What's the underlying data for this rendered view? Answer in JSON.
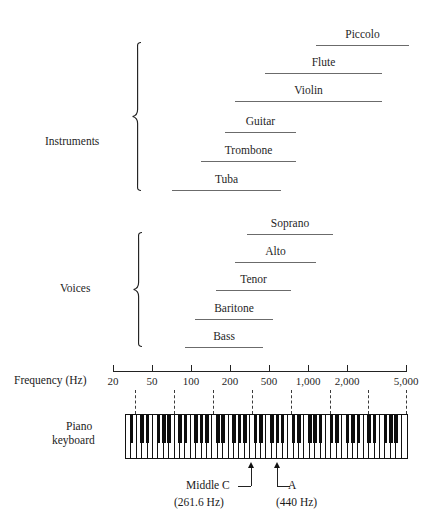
{
  "figure": {
    "groups": [
      {
        "name": "Instruments",
        "label": "Instruments",
        "label_x": 45,
        "label_y": 135,
        "brace_x": 132,
        "brace_top": 42,
        "brace_bottom": 191,
        "items": [
          {
            "label": "Piccolo",
            "bar_x1": 316,
            "bar_x2": 409,
            "bar_y": 45,
            "label_y": 28
          },
          {
            "label": "Flute",
            "bar_x1": 265,
            "bar_x2": 382,
            "bar_y": 73,
            "label_y": 56
          },
          {
            "label": "Violin",
            "bar_x1": 235,
            "bar_x2": 382,
            "bar_y": 101,
            "label_y": 84
          },
          {
            "label": "Guitar",
            "bar_x1": 225,
            "bar_x2": 296,
            "bar_y": 132,
            "label_y": 115
          },
          {
            "label": "Trombone",
            "bar_x1": 201,
            "bar_x2": 296,
            "bar_y": 161,
            "label_y": 144
          },
          {
            "label": "Tuba",
            "bar_x1": 172,
            "bar_x2": 281,
            "bar_y": 190,
            "label_y": 173
          }
        ]
      },
      {
        "name": "Voices",
        "label": "Voices",
        "label_x": 60,
        "label_y": 282,
        "brace_x": 133,
        "brace_top": 232,
        "brace_bottom": 347,
        "items": [
          {
            "label": "Soprano",
            "bar_x1": 247,
            "bar_x2": 333,
            "bar_y": 234,
            "label_y": 217
          },
          {
            "label": "Alto",
            "bar_x1": 235,
            "bar_x2": 316,
            "bar_y": 262,
            "label_y": 245
          },
          {
            "label": "Tenor",
            "bar_x1": 216,
            "bar_x2": 291,
            "bar_y": 290,
            "label_y": 273
          },
          {
            "label": "Baritone",
            "bar_x1": 195,
            "bar_x2": 273,
            "bar_y": 319,
            "label_y": 302
          },
          {
            "label": "Bass",
            "bar_x1": 185,
            "bar_x2": 263,
            "bar_y": 347,
            "label_y": 330
          }
        ]
      }
    ],
    "axis": {
      "title": "Frequency (Hz)",
      "title_x": 14,
      "title_y": 374,
      "line_y": 371,
      "line_x1": 113,
      "line_x2": 407,
      "tick_height": 6,
      "ticks": [
        {
          "label": "20",
          "x": 113
        },
        {
          "label": "50",
          "x": 152
        },
        {
          "label": "100",
          "x": 191
        },
        {
          "label": "200",
          "x": 230
        },
        {
          "label": "500",
          "x": 269
        },
        {
          "label": "1,000",
          "x": 308
        },
        {
          "label": "2,000",
          "x": 347
        },
        {
          "label": "5,000",
          "x": 406
        }
      ],
      "dashed_lines": [
        {
          "x": 135
        },
        {
          "x": 174
        },
        {
          "x": 213
        },
        {
          "x": 252
        },
        {
          "x": 291
        },
        {
          "x": 330
        },
        {
          "x": 368
        },
        {
          "x": 406
        }
      ],
      "dash_top": 390,
      "dash_bottom": 414
    },
    "keyboard": {
      "title_line1": "Piano",
      "title_line2": "keyboard",
      "title_x": 66,
      "title_y": 420,
      "x": 125,
      "y": 414,
      "width": 283,
      "height": 45,
      "white_key_count": 52,
      "black_key_pattern": [
        1,
        1,
        0,
        1,
        1,
        1,
        0
      ]
    },
    "annotations": [
      {
        "name": "middle-c",
        "line1": "Middle C",
        "line2": "(261.6 Hz)",
        "arrow_x": 251,
        "arrow_y": 462,
        "leader_bottom": 486,
        "text_x": 186,
        "text_y": 481,
        "leader_dir": "left"
      },
      {
        "name": "a440",
        "line1": "A",
        "line2": "(440 Hz)",
        "arrow_x": 277,
        "arrow_y": 462,
        "leader_bottom": 486,
        "text_x": 288,
        "text_y": 481,
        "leader_dir": "right"
      }
    ],
    "colors": {
      "bar": "#6b6b6b",
      "text": "#1f1f1f",
      "axis": "#222222",
      "black_key": "#0d0d0d"
    }
  },
  "chart_data": {
    "type": "bar",
    "xlabel": "Frequency (Hz)",
    "ylabel": "",
    "xscale": "log",
    "xlim": [
      20,
      5000
    ],
    "xticks": [
      20,
      50,
      100,
      200,
      500,
      1000,
      2000,
      5000
    ],
    "xtick_labels": [
      "20",
      "50",
      "100",
      "200",
      "500",
      "1,000",
      "2,000",
      "5,000"
    ],
    "grid": "dashed vertical",
    "legend": "none",
    "series": [
      {
        "name": "Piccolo",
        "group": "Instruments",
        "range_hz": [
          500,
          4700
        ]
      },
      {
        "name": "Flute",
        "group": "Instruments",
        "range_hz": [
          250,
          2400
        ]
      },
      {
        "name": "Violin",
        "group": "Instruments",
        "range_hz": [
          200,
          2400
        ]
      },
      {
        "name": "Guitar",
        "group": "Instruments",
        "range_hz": [
          82,
          330
        ]
      },
      {
        "name": "Trombone",
        "group": "Instruments",
        "range_hz": [
          55,
          330
        ]
      },
      {
        "name": "Tuba",
        "group": "Instruments",
        "range_hz": [
          35,
          230
        ]
      },
      {
        "name": "Soprano",
        "group": "Voices",
        "range_hz": [
          260,
          1050
        ]
      },
      {
        "name": "Alto",
        "group": "Voices",
        "range_hz": [
          200,
          700
        ]
      },
      {
        "name": "Tenor",
        "group": "Voices",
        "range_hz": [
          130,
          440
        ]
      },
      {
        "name": "Baritone",
        "group": "Voices",
        "range_hz": [
          90,
          330
        ]
      },
      {
        "name": "Bass",
        "group": "Voices",
        "range_hz": [
          75,
          260
        ]
      }
    ],
    "annotations": [
      {
        "label": "Middle C",
        "value_hz": 261.6
      },
      {
        "label": "A",
        "value_hz": 440
      }
    ]
  }
}
